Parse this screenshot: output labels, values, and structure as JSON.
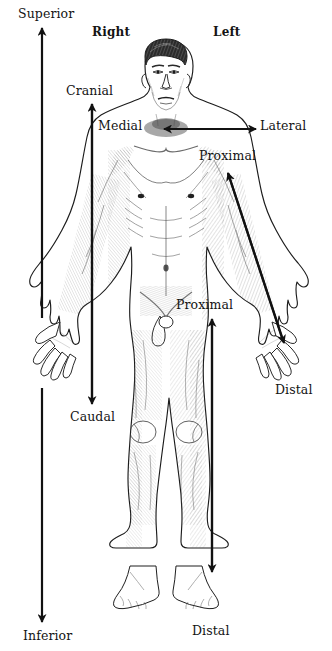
{
  "figure": {
    "background_color": "#ffffff",
    "ink_color": "#141414"
  },
  "orientation_labels": {
    "right": "Right",
    "left": "Left"
  },
  "direction_labels": {
    "superior": "Superior",
    "inferior": "Inferior",
    "cranial": "Cranial",
    "caudal": "Caudal",
    "medial": "Medial",
    "lateral": "Lateral",
    "proximal_arm": "Proximal",
    "distal_arm": "Distal",
    "proximal_leg": "Proximal",
    "distal_leg": "Distal"
  },
  "arrows": [
    {
      "id": "superior-inferior-axis",
      "labels": [
        "Superior",
        "Inferior"
      ],
      "orientation": "vertical",
      "heads": "both",
      "note": "full-height body axis arrow at far left, interrupted where the right hand overlaps"
    },
    {
      "id": "cranial-caudal-axis",
      "labels": [
        "Cranial",
        "Caudal"
      ],
      "orientation": "vertical",
      "heads": "both",
      "note": "inner vertical arrow beside the torso"
    },
    {
      "id": "medial-lateral-axis",
      "labels": [
        "Medial",
        "Lateral"
      ],
      "orientation": "horizontal",
      "heads": "both",
      "note": "horizontal arrow at neck level pointing inward to midline and outward to the side"
    },
    {
      "id": "arm-proximal-distal-axis",
      "labels": [
        "Proximal",
        "Distal"
      ],
      "orientation": "diagonal",
      "heads": "both",
      "note": "diagonal arrow along the left arm from shoulder to hand"
    },
    {
      "id": "leg-proximal-distal-axis",
      "labels": [
        "Proximal",
        "Distal"
      ],
      "orientation": "vertical",
      "heads": "both",
      "note": "vertical arrow along the left leg from hip to foot"
    }
  ]
}
